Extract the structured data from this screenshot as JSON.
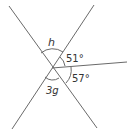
{
  "diagram": {
    "type": "intersecting-lines-angles",
    "labels": {
      "h": "h",
      "a51": "51°",
      "a57": "57°",
      "g3": "3g"
    },
    "colors": {
      "line": "#6a6a6a",
      "text": "#333333"
    }
  }
}
